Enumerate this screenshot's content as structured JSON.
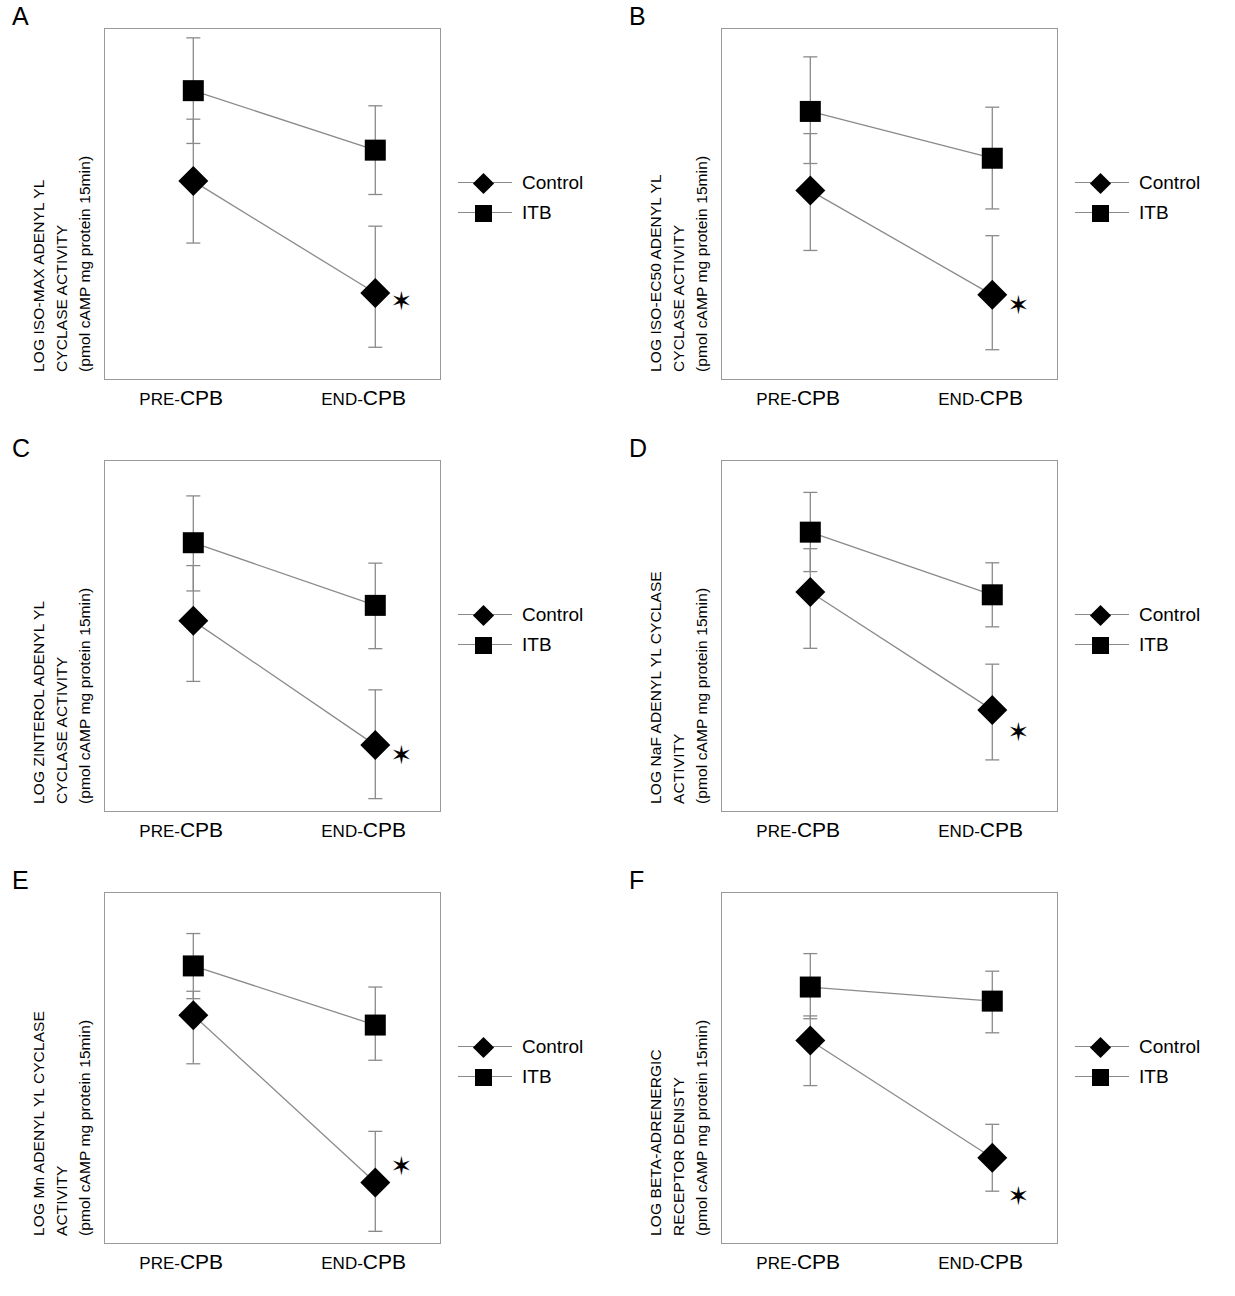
{
  "figure": {
    "xtick_prefix_1": "PRE-",
    "xtick_prefix_2": "END-",
    "xtick_suffix": "CPB",
    "unit_label": "(pmol cAMP mg protein 15min)",
    "significance_marker": "✶",
    "marker_color": "#000000",
    "frame_color": "#9a9a9a",
    "line_color": "#8a8a8a"
  },
  "legend": {
    "entries": [
      {
        "label": "Control",
        "marker": "diamond"
      },
      {
        "label": "ITB",
        "marker": "square"
      }
    ]
  },
  "panels": [
    {
      "letter": "A",
      "ylabel_lines": [
        "LOG ISO-MAX ADENYL YL",
        "CYCLASE ACTIVITY"
      ]
    },
    {
      "letter": "B",
      "ylabel_lines": [
        "LOG ISO-EC50 ADENYL YL",
        "CYCLASE ACTIVITY"
      ]
    },
    {
      "letter": "C",
      "ylabel_lines": [
        "LOG ZINTEROL ADENYL YL",
        "CYCLASE ACTIVITY"
      ]
    },
    {
      "letter": "D",
      "ylabel_lines": [
        "LOG NaF ADENYL YL CYCLASE",
        "ACTIVITY"
      ]
    },
    {
      "letter": "E",
      "ylabel_lines": [
        "LOG Mn ADENYL YL CYCLASE",
        "ACTIVITY"
      ]
    },
    {
      "letter": "F",
      "ylabel_lines": [
        "LOG BETA-ADRENERGIC",
        "RECEPTOR DENISTY"
      ]
    }
  ],
  "chart_data": [
    {
      "type": "line",
      "panel": "A",
      "title": "LOG ISO-MAX ADENYL YL CYCLASE ACTIVITY",
      "ylabel": "LOG ISO-MAX ADENYL YL CYCLASE ACTIVITY (pmol cAMP mg protein 15min)",
      "xlabel": "",
      "categories": [
        "PRE-CPB",
        "END-CPB"
      ],
      "grid": false,
      "axis_tick_labels": [],
      "legend_position": "right",
      "significance": {
        "series": "Control",
        "category": "END-CPB",
        "marker": "✶"
      },
      "series": [
        {
          "name": "ITB",
          "marker": "square",
          "values": [
            0.822,
            0.653
          ],
          "err_low": [
            0.672,
            0.527
          ],
          "err_high": [
            0.972,
            0.779
          ]
        },
        {
          "name": "Control",
          "marker": "diamond",
          "values": [
            0.565,
            0.247
          ],
          "err_low": [
            0.389,
            0.093
          ],
          "err_high": [
            0.741,
            0.437
          ]
        }
      ]
    },
    {
      "type": "line",
      "panel": "B",
      "title": "LOG ISO-EC50 ADENYL YL CYCLASE ACTIVITY",
      "ylabel": "LOG ISO-EC50 ADENYL YL CYCLASE ACTIVITY (pmol cAMP mg protein 15min)",
      "xlabel": "",
      "categories": [
        "PRE-CPB",
        "END-CPB"
      ],
      "grid": false,
      "axis_tick_labels": [],
      "legend_position": "right",
      "significance": {
        "series": "Control",
        "category": "END-CPB",
        "marker": "✶"
      },
      "series": [
        {
          "name": "ITB",
          "marker": "square",
          "values": [
            0.763,
            0.63
          ],
          "err_low": [
            0.615,
            0.486
          ],
          "err_high": [
            0.918,
            0.775
          ]
        },
        {
          "name": "Control",
          "marker": "diamond",
          "values": [
            0.538,
            0.242
          ],
          "err_low": [
            0.368,
            0.086
          ],
          "err_high": [
            0.7,
            0.41
          ]
        }
      ]
    },
    {
      "type": "line",
      "panel": "C",
      "title": "LOG ZINTEROL ADENYL YL CYCLASE ACTIVITY",
      "ylabel": "LOG ZINTEROL ADENYL YL CYCLASE ACTIVITY (pmol cAMP mg protein 15min)",
      "xlabel": "",
      "categories": [
        "PRE-CPB",
        "END-CPB"
      ],
      "grid": false,
      "axis_tick_labels": [],
      "legend_position": "right",
      "significance": {
        "series": "Control",
        "category": "END-CPB",
        "marker": "✶"
      },
      "series": [
        {
          "name": "ITB",
          "marker": "square",
          "values": [
            0.765,
            0.587
          ],
          "err_low": [
            0.628,
            0.464
          ],
          "err_high": [
            0.898,
            0.707
          ]
        },
        {
          "name": "Control",
          "marker": "diamond",
          "values": [
            0.543,
            0.19
          ],
          "err_low": [
            0.371,
            0.038
          ],
          "err_high": [
            0.7,
            0.347
          ]
        }
      ]
    },
    {
      "type": "line",
      "panel": "D",
      "title": "LOG NaF ADENYL YL CYCLASE ACTIVITY",
      "ylabel": "LOG NaF ADENYL YL CYCLASE ACTIVITY (pmol cAMP mg protein 15min)",
      "xlabel": "",
      "categories": [
        "PRE-CPB",
        "END-CPB"
      ],
      "grid": false,
      "axis_tick_labels": [],
      "legend_position": "right",
      "significance": {
        "series": "Control",
        "category": "END-CPB",
        "marker": "✶"
      },
      "series": [
        {
          "name": "ITB",
          "marker": "square",
          "values": [
            0.795,
            0.617
          ],
          "err_low": [
            0.683,
            0.526
          ],
          "err_high": [
            0.908,
            0.708
          ]
        },
        {
          "name": "Control",
          "marker": "diamond",
          "values": [
            0.625,
            0.29
          ],
          "err_low": [
            0.465,
            0.148
          ],
          "err_high": [
            0.748,
            0.42
          ]
        }
      ]
    },
    {
      "type": "line",
      "panel": "E",
      "title": "LOG Mn ADENYL YL CYCLASE ACTIVITY",
      "ylabel": "LOG Mn ADENYL YL CYCLASE ACTIVITY (pmol cAMP mg protein 15min)",
      "xlabel": "",
      "categories": [
        "PRE-CPB",
        "END-CPB"
      ],
      "grid": false,
      "axis_tick_labels": [],
      "legend_position": "right",
      "significance": {
        "series": "Control",
        "category": "END-CPB",
        "marker": "✶"
      },
      "series": [
        {
          "name": "ITB",
          "marker": "square",
          "values": [
            0.79,
            0.622
          ],
          "err_low": [
            0.697,
            0.522
          ],
          "err_high": [
            0.882,
            0.73
          ]
        },
        {
          "name": "Control",
          "marker": "diamond",
          "values": [
            0.65,
            0.175
          ],
          "err_low": [
            0.512,
            0.036
          ],
          "err_high": [
            0.718,
            0.32
          ]
        }
      ]
    },
    {
      "type": "line",
      "panel": "F",
      "title": "LOG BETA-ADRENERGIC RECEPTOR DENISTY",
      "ylabel": "LOG BETA-ADRENERGIC RECEPTOR DENISTY (pmol cAMP mg protein 15min)",
      "xlabel": "",
      "categories": [
        "PRE-CPB",
        "END-CPB"
      ],
      "grid": false,
      "axis_tick_labels": [],
      "legend_position": "right",
      "significance": {
        "series": "Control",
        "category": "END-CPB",
        "marker": "✶"
      },
      "series": [
        {
          "name": "ITB",
          "marker": "square",
          "values": [
            0.73,
            0.69
          ],
          "err_low": [
            0.64,
            0.6
          ],
          "err_high": [
            0.825,
            0.775
          ]
        },
        {
          "name": "Control",
          "marker": "diamond",
          "values": [
            0.578,
            0.245
          ],
          "err_low": [
            0.45,
            0.15
          ],
          "err_high": [
            0.648,
            0.34
          ]
        }
      ]
    }
  ]
}
